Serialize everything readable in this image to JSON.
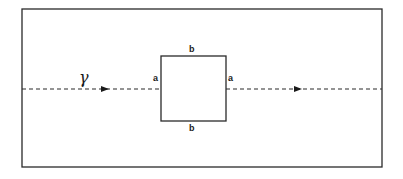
{
  "diagram": {
    "title": "",
    "colors": {
      "stroke": "#2a2a2a",
      "background": "#ffffff"
    },
    "outer_frame": {
      "x": 22,
      "y": 9,
      "width": 360,
      "height": 158
    },
    "inner_square": {
      "x": 161,
      "y": 56,
      "width": 65,
      "height": 65
    },
    "beam": {
      "label": "γ",
      "y": 89,
      "style": "dashed",
      "direction": "left-to-right",
      "arrow_positions_x": [
        105,
        298
      ]
    },
    "side_labels": {
      "top": "b",
      "bottom": "b",
      "left": "a",
      "right": "a"
    }
  }
}
